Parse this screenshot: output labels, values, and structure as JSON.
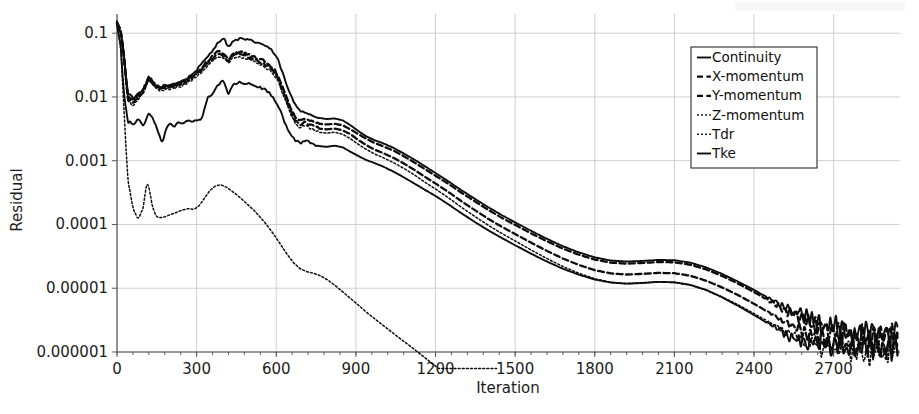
{
  "chart_data": {
    "type": "line",
    "title": "",
    "xlabel": "Iteration",
    "ylabel": "Residual",
    "yscale": "log",
    "xlim": [
      0,
      2950
    ],
    "ylim": [
      1e-06,
      0.2
    ],
    "grid": true,
    "legend_position": "top-right",
    "xticks": [
      0,
      300,
      600,
      900,
      1200,
      1500,
      1800,
      2100,
      2400,
      2700
    ],
    "xtick_labels": [
      "0",
      "300",
      "600",
      "900",
      "1200",
      "1500",
      "1800",
      "2100",
      "2400",
      "2700"
    ],
    "yticks": [
      0.1,
      0.01,
      0.001,
      0.0001,
      1e-05,
      1e-06
    ],
    "ytick_labels": [
      "0.1",
      "0.01",
      "0.001",
      "0.0001",
      "0.00001",
      "0.000001"
    ],
    "series": [
      {
        "name": "Continuity",
        "style": "solid",
        "x": [
          0,
          15,
          25,
          40,
          60,
          80,
          100,
          120,
          140,
          160,
          180,
          200,
          230,
          260,
          290,
          320,
          350,
          380,
          400,
          420,
          440,
          460,
          480,
          500,
          520,
          545,
          570,
          590,
          610,
          630,
          650,
          670,
          690,
          710,
          730,
          760,
          790,
          820,
          850,
          880,
          910,
          940,
          970,
          1000,
          1040,
          1080,
          1120,
          1160,
          1200,
          1250,
          1300,
          1350,
          1400,
          1450,
          1500,
          1560,
          1620,
          1680,
          1740,
          1800,
          1860,
          1920,
          1980,
          2040,
          2100,
          2160,
          2220,
          2280,
          2340,
          2400,
          2460,
          2520,
          2580,
          2640,
          2700,
          2760,
          2820,
          2880,
          2940
        ],
        "y": [
          0.15,
          0.1,
          0.05,
          0.012,
          0.0095,
          0.011,
          0.013,
          0.018,
          0.0155,
          0.014,
          0.015,
          0.0155,
          0.017,
          0.019,
          0.024,
          0.033,
          0.048,
          0.07,
          0.085,
          0.062,
          0.075,
          0.082,
          0.08,
          0.077,
          0.073,
          0.068,
          0.06,
          0.05,
          0.035,
          0.02,
          0.0115,
          0.0078,
          0.0062,
          0.0058,
          0.0052,
          0.0047,
          0.0045,
          0.0046,
          0.0043,
          0.0036,
          0.0029,
          0.0024,
          0.0021,
          0.0019,
          0.0016,
          0.0013,
          0.00104,
          0.00082,
          0.00064,
          0.00047,
          0.00034,
          0.00025,
          0.000185,
          0.00014,
          0.000108,
          7.95e-05,
          5.95e-05,
          4.55e-05,
          3.65e-05,
          3.05e-05,
          2.72e-05,
          2.62e-05,
          2.68e-05,
          2.78e-05,
          2.75e-05,
          2.52e-05,
          2.12e-05,
          1.68e-05,
          1.27e-05,
          9.4e-06,
          6.8e-06,
          4.9e-06,
          3.6e-06,
          2.8e-06,
          2.3e-06,
          2.1e-06,
          2e-06,
          2e-06,
          2e-06
        ]
      },
      {
        "name": "X-momentum",
        "style": "dashed",
        "x": [
          0,
          15,
          25,
          40,
          60,
          80,
          100,
          120,
          140,
          160,
          180,
          200,
          230,
          260,
          290,
          320,
          350,
          380,
          400,
          420,
          440,
          460,
          480,
          500,
          520,
          545,
          570,
          590,
          610,
          630,
          650,
          670,
          690,
          710,
          730,
          760,
          790,
          820,
          850,
          880,
          910,
          940,
          970,
          1000,
          1040,
          1080,
          1120,
          1160,
          1200,
          1250,
          1300,
          1350,
          1400,
          1450,
          1500,
          1560,
          1620,
          1680,
          1740,
          1800,
          1860,
          1920,
          1980,
          2040,
          2100,
          2160,
          2220,
          2280,
          2340,
          2400,
          2460,
          2520,
          2580,
          2640,
          2700,
          2760,
          2820,
          2880,
          2940
        ],
        "y": [
          0.15,
          0.1,
          0.05,
          0.0105,
          0.0088,
          0.0105,
          0.0135,
          0.0215,
          0.0165,
          0.014,
          0.0145,
          0.0148,
          0.016,
          0.018,
          0.022,
          0.029,
          0.04,
          0.052,
          0.047,
          0.04,
          0.05,
          0.051,
          0.0485,
          0.045,
          0.042,
          0.038,
          0.033,
          0.028,
          0.02,
          0.0125,
          0.0073,
          0.0048,
          0.0042,
          0.0046,
          0.0042,
          0.0038,
          0.0037,
          0.0038,
          0.0036,
          0.0031,
          0.0026,
          0.0022,
          0.0019,
          0.0017,
          0.00145,
          0.00118,
          0.00094,
          0.00074,
          0.00058,
          0.00043,
          0.00031,
          0.000228,
          0.000168,
          0.000127,
          9.85e-05,
          7.25e-05,
          5.45e-05,
          4.18e-05,
          3.36e-05,
          2.82e-05,
          2.52e-05,
          2.43e-05,
          2.49e-05,
          2.58e-05,
          2.55e-05,
          2.34e-05,
          1.97e-05,
          1.56e-05,
          1.18e-05,
          8.7e-06,
          6.3e-06,
          4.5e-06,
          3.3e-06,
          2.6e-06,
          2.1e-06,
          1.9e-06,
          1.8e-06,
          1.8e-06,
          1.8e-06
        ]
      },
      {
        "name": "Y-momentum",
        "style": "dashed",
        "x": [
          0,
          15,
          25,
          40,
          60,
          80,
          100,
          120,
          140,
          160,
          180,
          200,
          230,
          260,
          290,
          320,
          350,
          380,
          400,
          420,
          440,
          460,
          480,
          500,
          520,
          545,
          570,
          590,
          610,
          630,
          650,
          670,
          690,
          710,
          730,
          760,
          790,
          820,
          850,
          880,
          910,
          940,
          970,
          1000,
          1040,
          1080,
          1120,
          1160,
          1200,
          1250,
          1300,
          1350,
          1400,
          1450,
          1500,
          1560,
          1620,
          1680,
          1740,
          1800,
          1860,
          1920,
          1980,
          2040,
          2100,
          2160,
          2220,
          2280,
          2340,
          2400,
          2460,
          2520,
          2580,
          2640,
          2700,
          2760,
          2820,
          2880,
          2940
        ],
        "y": [
          0.15,
          0.1,
          0.048,
          0.0095,
          0.008,
          0.0098,
          0.0125,
          0.0205,
          0.0158,
          0.0132,
          0.0138,
          0.0142,
          0.0152,
          0.0172,
          0.021,
          0.027,
          0.037,
          0.048,
          0.044,
          0.037,
          0.046,
          0.047,
          0.0445,
          0.041,
          0.038,
          0.034,
          0.03,
          0.025,
          0.018,
          0.0112,
          0.0066,
          0.0043,
          0.0037,
          0.004,
          0.0036,
          0.0032,
          0.0031,
          0.0032,
          0.003,
          0.0026,
          0.0021,
          0.00175,
          0.0015,
          0.00133,
          0.00112,
          0.00091,
          0.00072,
          0.00056,
          0.00044,
          0.00032,
          0.000228,
          0.000166,
          0.000122,
          9.2e-05,
          7.08e-05,
          5.18e-05,
          3.85e-05,
          2.92e-05,
          2.32e-05,
          1.92e-05,
          1.71e-05,
          1.64e-05,
          1.68e-05,
          1.74e-05,
          1.72e-05,
          1.57e-05,
          1.31e-05,
          1.03e-05,
          7.8e-06,
          5.7e-06,
          4.1e-06,
          3e-06,
          2.2e-06,
          1.7e-06,
          1.4e-06,
          1.3e-06,
          1.2e-06,
          1.2e-06,
          1.2e-06
        ]
      },
      {
        "name": "Z-momentum",
        "style": "dotted",
        "x": [
          0,
          15,
          25,
          40,
          60,
          80,
          100,
          120,
          140,
          160,
          180,
          200,
          230,
          260,
          290,
          320,
          350,
          380,
          400,
          420,
          440,
          460,
          480,
          500,
          520,
          545,
          570,
          590,
          610,
          630,
          650,
          670,
          690,
          710,
          730,
          760,
          790,
          820,
          850,
          880,
          910,
          940,
          970,
          1000,
          1040,
          1080,
          1120,
          1160,
          1200,
          1250,
          1300,
          1350,
          1400,
          1450,
          1500,
          1560,
          1620,
          1680,
          1740,
          1800,
          1860,
          1920,
          1980,
          2040,
          2100,
          2160,
          2220,
          2280,
          2340,
          2400,
          2460,
          2520,
          2580,
          2640,
          2700,
          2760,
          2820,
          2880,
          2940
        ],
        "y": [
          0.15,
          0.098,
          0.045,
          0.0088,
          0.0074,
          0.009,
          0.0115,
          0.019,
          0.0148,
          0.0124,
          0.0129,
          0.0133,
          0.0142,
          0.016,
          0.0195,
          0.025,
          0.034,
          0.044,
          0.0405,
          0.034,
          0.042,
          0.043,
          0.041,
          0.0378,
          0.035,
          0.0312,
          0.0275,
          0.023,
          0.0165,
          0.0102,
          0.006,
          0.0039,
          0.0033,
          0.0036,
          0.0032,
          0.0028,
          0.0027,
          0.0028,
          0.0026,
          0.0022,
          0.0018,
          0.0015,
          0.00128,
          0.00113,
          0.00094,
          0.00076,
          0.0006,
          0.00046,
          0.00036,
          0.00026,
          0.000183,
          0.000132,
          9.65e-05,
          7.22e-05,
          5.52e-05,
          3.98e-05,
          2.92e-05,
          2.19e-05,
          1.72e-05,
          1.41e-05,
          1.24e-05,
          1.18e-05,
          1.21e-05,
          1.25e-05,
          1.23e-05,
          1.12e-05,
          9.3e-06,
          7.3e-06,
          5.5e-06,
          4e-06,
          2.9e-06,
          2.1e-06,
          1.6e-06,
          1.3e-06,
          1.1e-06,
          1.1e-06,
          1e-06,
          1e-06,
          1e-06
        ]
      },
      {
        "name": "Tdr",
        "style": "dotted",
        "x": [
          0,
          15,
          25,
          40,
          60,
          80,
          100,
          110,
          120,
          135,
          150,
          165,
          180,
          200,
          220,
          245,
          270,
          290,
          310,
          330,
          350,
          370,
          390,
          410,
          430,
          450,
          470,
          490,
          515,
          540,
          565,
          590,
          615,
          640,
          665,
          690,
          715,
          740,
          765,
          790,
          820,
          850,
          880,
          910,
          940,
          980,
          1020,
          1060,
          1100,
          1150,
          1200,
          1250,
          1300,
          1350,
          1400,
          1430
        ],
        "y": [
          0.15,
          0.05,
          0.008,
          0.00055,
          0.00018,
          0.00012,
          0.00019,
          0.00042,
          0.00039,
          0.00018,
          0.00013,
          0.000128,
          0.000132,
          0.000142,
          0.000152,
          0.000168,
          0.000178,
          0.000172,
          0.000198,
          0.00026,
          0.00034,
          0.0004,
          0.00042,
          0.00039,
          0.00034,
          0.000295,
          0.00025,
          0.00021,
          0.000168,
          0.00013,
          9.75e-05,
          7.05e-05,
          4.95e-05,
          3.45e-05,
          2.52e-05,
          2.02e-05,
          1.82e-05,
          1.72e-05,
          1.58e-05,
          1.38e-05,
          1.12e-05,
          8.8e-06,
          6.9e-06,
          5.4e-06,
          4.2e-06,
          3.1e-06,
          2.3e-06,
          1.7e-06,
          1.28e-06,
          8.8e-07,
          6e-07,
          4.2e-07,
          3e-07,
          2.1e-07,
          1.4e-07,
          1e-07
        ]
      },
      {
        "name": "Tke",
        "style": "solid",
        "x": [
          0,
          15,
          25,
          40,
          60,
          80,
          100,
          120,
          140,
          155,
          170,
          185,
          200,
          215,
          230,
          245,
          260,
          275,
          290,
          305,
          320,
          340,
          360,
          380,
          400,
          420,
          440,
          460,
          480,
          500,
          520,
          545,
          570,
          590,
          610,
          630,
          650,
          670,
          690,
          710,
          730,
          760,
          790,
          820,
          850,
          880,
          910,
          940,
          970,
          1000,
          1040,
          1080,
          1120,
          1160,
          1200,
          1250,
          1300,
          1350,
          1400,
          1450,
          1500,
          1560,
          1620,
          1680,
          1740,
          1800,
          1860,
          1920,
          1980,
          2040,
          2100,
          2160,
          2220,
          2280,
          2340,
          2400,
          2460,
          2520,
          2580,
          2640,
          2700,
          2760,
          2820,
          2880,
          2940
        ],
        "y": [
          0.14,
          0.06,
          0.012,
          0.0042,
          0.0038,
          0.0044,
          0.0035,
          0.0058,
          0.0042,
          0.0028,
          0.0019,
          0.0031,
          0.0038,
          0.0034,
          0.0042,
          0.0039,
          0.0041,
          0.0043,
          0.0042,
          0.0044,
          0.0046,
          0.0095,
          0.011,
          0.0155,
          0.0175,
          0.0115,
          0.0162,
          0.0168,
          0.0165,
          0.0158,
          0.015,
          0.0138,
          0.012,
          0.0098,
          0.0068,
          0.0042,
          0.0028,
          0.0021,
          0.0019,
          0.0021,
          0.0019,
          0.0017,
          0.00165,
          0.00172,
          0.00162,
          0.00138,
          0.00118,
          0.00102,
          0.00092,
          0.00082,
          0.00068,
          0.00055,
          0.00044,
          0.00035,
          0.00028,
          0.000205,
          0.000148,
          0.000108,
          8.05e-05,
          6.12e-05,
          4.72e-05,
          3.48e-05,
          2.62e-05,
          2.02e-05,
          1.63e-05,
          1.37e-05,
          1.23e-05,
          1.18e-05,
          1.21e-05,
          1.26e-05,
          1.24e-05,
          1.13e-05,
          9.4e-06,
          7.2e-06,
          5.3e-06,
          3.8e-06,
          2.7e-06,
          1.9e-06,
          1.5e-06,
          1.3e-06,
          1.2e-06,
          1.2e-06,
          1.2e-06,
          1.2e-06,
          1.2e-06
        ]
      }
    ]
  },
  "legend": {
    "items": [
      {
        "label": "Continuity",
        "style": "solid"
      },
      {
        "label": "X-momentum",
        "style": "dashed"
      },
      {
        "label": "Y-momentum",
        "style": "dashed"
      },
      {
        "label": "Z-momentum",
        "style": "dotted"
      },
      {
        "label": "Tdr",
        "style": "dotted"
      },
      {
        "label": "Tke",
        "style": "solid"
      }
    ]
  }
}
